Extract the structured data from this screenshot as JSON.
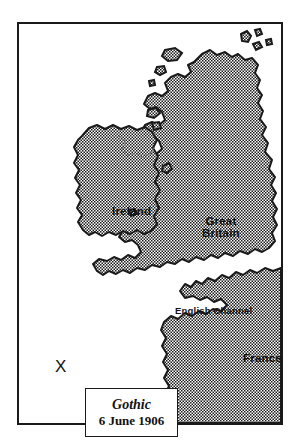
{
  "figure": {
    "type": "map",
    "frame": {
      "border_color": "#1a1a1a",
      "background": "#ffffff"
    },
    "land_fill": {
      "pattern": "halftone-dots",
      "ink_color": "#1a1a1a",
      "paper_color": "#ffffff"
    },
    "sea_fill": "#ffffff"
  },
  "labels": {
    "ireland": "Ireland",
    "great_britain_line1": "Great",
    "great_britain_line2": "Britain",
    "english_channel": "English Channel",
    "france": "France"
  },
  "marker": {
    "symbol": "X",
    "meaning": "position marker"
  },
  "caption": {
    "ship_name": "Gothic",
    "date": "6 June 1906"
  }
}
